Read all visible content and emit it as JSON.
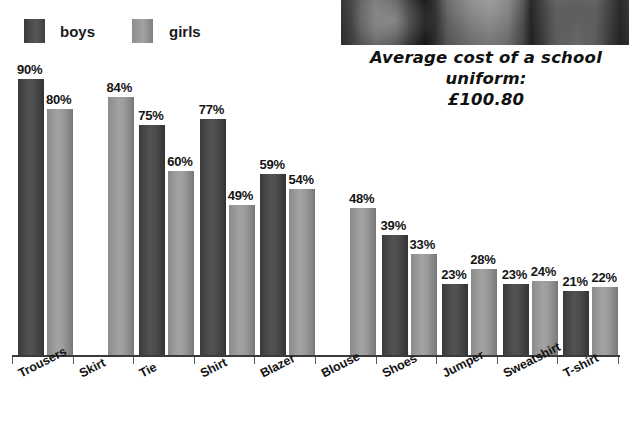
{
  "top_headline": "",
  "legend": {
    "boys_label": "boys",
    "girls_label": "girls",
    "boys_color": "#4a4a4a",
    "girls_color": "#969696"
  },
  "photo": {
    "alt_name": "school-uniform-photo"
  },
  "caption": {
    "line1": "Average cost of a school uniform:",
    "line2": "£100.80"
  },
  "chart_data": {
    "type": "bar",
    "title": "Average cost of a school uniform: £100.80",
    "xlabel": "",
    "ylabel": "",
    "ylim": [
      0,
      100
    ],
    "grid": false,
    "legend_position": "top-left",
    "value_suffix": "%",
    "categories": [
      "Trousers",
      "Skirt",
      "Tie",
      "Shirt",
      "Blazer",
      "Blouse",
      "Shoes",
      "Jumper",
      "Sweatshirt",
      "T-shirt"
    ],
    "series": [
      {
        "name": "boys",
        "values": [
          90,
          null,
          75,
          77,
          59,
          null,
          39,
          23,
          23,
          21
        ]
      },
      {
        "name": "girls",
        "values": [
          80,
          84,
          60,
          49,
          54,
          48,
          33,
          28,
          24,
          22
        ]
      }
    ],
    "bars": [
      {
        "category": "Trousers",
        "series": "boys",
        "value": 90,
        "label": "90%"
      },
      {
        "category": "Trousers",
        "series": "girls",
        "value": 80,
        "label": "80%"
      },
      {
        "category": "Skirt",
        "series": "girls",
        "value": 84,
        "label": "84%"
      },
      {
        "category": "Tie",
        "series": "boys",
        "value": 75,
        "label": "75%"
      },
      {
        "category": "Tie",
        "series": "girls",
        "value": 60,
        "label": "60%"
      },
      {
        "category": "Shirt",
        "series": "boys",
        "value": 77,
        "label": "77%"
      },
      {
        "category": "Shirt",
        "series": "girls",
        "value": 49,
        "label": "49%"
      },
      {
        "category": "Blazer",
        "series": "boys",
        "value": 59,
        "label": "59%"
      },
      {
        "category": "Blazer",
        "series": "girls",
        "value": 54,
        "label": "54%"
      },
      {
        "category": "Blouse",
        "series": "girls",
        "value": 48,
        "label": "48%"
      },
      {
        "category": "Shoes",
        "series": "boys",
        "value": 39,
        "label": "39%"
      },
      {
        "category": "Shoes",
        "series": "girls",
        "value": 33,
        "label": "33%"
      },
      {
        "category": "Jumper",
        "series": "boys",
        "value": 23,
        "label": "23%"
      },
      {
        "category": "Jumper",
        "series": "girls",
        "value": 28,
        "label": "28%"
      },
      {
        "category": "Sweatshirt",
        "series": "boys",
        "value": 23,
        "label": "23%"
      },
      {
        "category": "Sweatshirt",
        "series": "girls",
        "value": 24,
        "label": "24%"
      },
      {
        "category": "T-shirt",
        "series": "boys",
        "value": 21,
        "label": "21%"
      },
      {
        "category": "T-shirt",
        "series": "girls",
        "value": 22,
        "label": "22%"
      }
    ]
  }
}
